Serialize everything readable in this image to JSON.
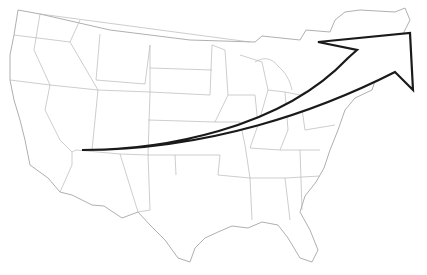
{
  "map": {
    "type": "outline-map",
    "region": "contiguous United States with state borders",
    "labels": [],
    "colors": {
      "background": "#ffffff",
      "state_border": "#b8b8b8",
      "arrow_stroke": "#1a1a1a",
      "arrow_fill": "#ffffff"
    },
    "annotation": {
      "type": "curved-arrow",
      "from": "Southwest (Arizona/New Mexico area)",
      "to": "Northeast (New England / Maine)",
      "direction": "northeast"
    }
  }
}
